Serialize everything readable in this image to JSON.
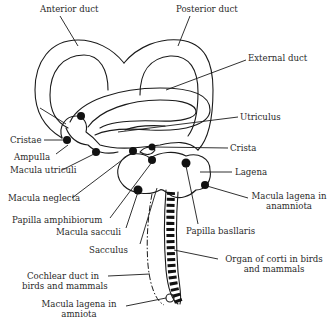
{
  "diagram": {
    "labels": {
      "anterior_duct": "Anterior duct",
      "posterior_duct": "Posterior duct",
      "external_duct": "External duct",
      "utriculus": "Utriculus",
      "crista": "Crista",
      "cristae": "Cristae",
      "ampulla": "Ampulla",
      "macula_utriculi": "Macula utriculi",
      "lagena": "Lagena",
      "macula_neglecta": "Macula neglecta",
      "macula_lagena_anamniota_1": "Macula lagena in",
      "macula_lagena_anamniota_2": "anamniota",
      "papilla_amphibiorum": "Papilla amphibiorum",
      "macula_sacculi": "Macula sacculi",
      "papilla_basilaris": "Papilla basllaris",
      "sacculus": "Sacculus",
      "organ_of_corti_1": "Organ of corti in birds",
      "organ_of_corti_2": "and mammals",
      "cochlear_duct_1": "Cochlear duct in",
      "cochlear_duct_2": "birds and mammals",
      "macula_lagena_amniota_1": "Macula lagena in",
      "macula_lagena_amniota_2": "amniota"
    },
    "colors": {
      "line": "#1a1a1a",
      "text": "#2a2a2a",
      "background": "#ffffff"
    }
  }
}
